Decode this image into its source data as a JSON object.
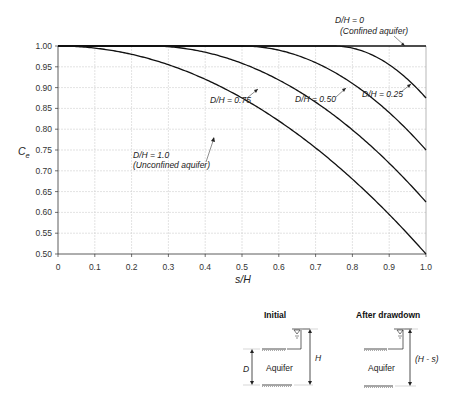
{
  "chart_data": {
    "type": "line",
    "title": "",
    "xlabel": "s/H",
    "ylabel": "Ce",
    "xlim": [
      0,
      1.0
    ],
    "ylim": [
      0.5,
      1.0
    ],
    "grid": true,
    "x_ticks": [
      "0",
      "0.1",
      "0.2",
      "0.3",
      "0.4",
      "0.5",
      "0.6",
      "0.7",
      "0.8",
      "0.9",
      "1.0"
    ],
    "y_ticks": [
      "1.00",
      "0.95",
      "0.90",
      "0.85",
      "0.80",
      "0.75",
      "0.70",
      "0.65",
      "0.60",
      "0.55",
      "0.50"
    ],
    "x": [
      0,
      0.1,
      0.2,
      0.25,
      0.3,
      0.4,
      0.5,
      0.6,
      0.7,
      0.75,
      0.8,
      0.9,
      1.0
    ],
    "series": [
      {
        "name": "D/H = 0 (Confined aquifer)",
        "values": [
          1.0,
          1.0,
          1.0,
          1.0,
          1.0,
          1.0,
          1.0,
          1.0,
          1.0,
          1.0,
          1.0,
          1.0,
          1.0
        ]
      },
      {
        "name": "D/H = 0.25",
        "values": [
          1.0,
          1.0,
          1.0,
          1.0,
          1.0,
          1.0,
          1.0,
          1.0,
          1.0,
          1.0,
          0.995,
          0.955,
          0.875
        ]
      },
      {
        "name": "D/H = 0.50",
        "values": [
          1.0,
          1.0,
          1.0,
          1.0,
          1.0,
          1.0,
          1.0,
          0.99,
          0.96,
          0.9375,
          0.91,
          0.84,
          0.75
        ]
      },
      {
        "name": "D/H = 0.75",
        "values": [
          1.0,
          1.0,
          1.0,
          1.0,
          0.998,
          0.975,
          0.94,
          0.893,
          0.833,
          0.8,
          0.76,
          0.693,
          0.625
        ]
      },
      {
        "name": "D/H = 1.0 (Unconfined aquifer)",
        "values": [
          1.0,
          0.95,
          0.9,
          0.875,
          0.85,
          0.8,
          0.75,
          0.7,
          0.65,
          0.625,
          0.6,
          0.55,
          0.5
        ]
      }
    ],
    "annotations": [
      {
        "text": "D/H = 0",
        "subtext": "(Confined aquifer)"
      },
      {
        "text": "D/H = 0.25"
      },
      {
        "text": "D/H = 0.50"
      },
      {
        "text": "D/H = 0.75"
      },
      {
        "text": "D/H = 1.0",
        "subtext": "(Unconfined aquifer)"
      }
    ]
  },
  "labels": {
    "ylabel_main": "C",
    "ylabel_sub": "e",
    "xlabel": "s/H",
    "dh0": "D/H = 0",
    "dh0_sub": "(Confined aquifer)",
    "dh025": "D/H = 0.25",
    "dh050": "D/H = 0.50",
    "dh075": "D/H = 0.75",
    "dh1": "D/H = 1.0",
    "dh1_sub": "(Unconfined aquifer)"
  },
  "diagram": {
    "initial": {
      "title": "Initial",
      "aquifer": "Aquifer",
      "d_label": "D",
      "h_label": "H"
    },
    "after": {
      "title": "After drawdown",
      "aquifer": "Aquifer",
      "h_label": "(H - s)"
    }
  }
}
